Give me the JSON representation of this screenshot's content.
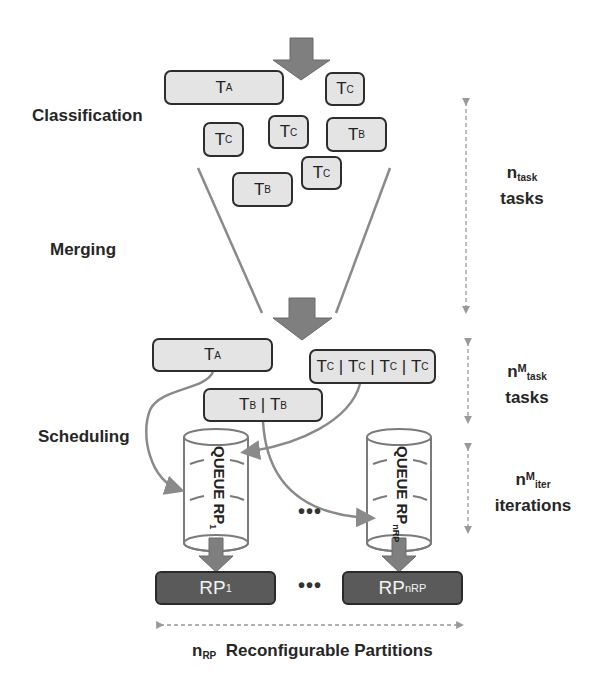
{
  "stages": {
    "classification": "Classification",
    "merging": "Merging",
    "scheduling": "Scheduling"
  },
  "classified_tasks": [
    {
      "base": "T",
      "sub": "A"
    },
    {
      "base": "T",
      "sub": "C"
    },
    {
      "base": "T",
      "sub": "C"
    },
    {
      "base": "T",
      "sub": "C"
    },
    {
      "base": "T",
      "sub": "B"
    },
    {
      "base": "T",
      "sub": "C"
    },
    {
      "base": "T",
      "sub": "B"
    }
  ],
  "merged_tasks": {
    "a": {
      "base": "T",
      "sub": "A"
    },
    "c_chain": [
      {
        "base": "T",
        "sub": "C"
      },
      {
        "base": "T",
        "sub": "C"
      },
      {
        "base": "T",
        "sub": "C"
      },
      {
        "base": "T",
        "sub": "C"
      }
    ],
    "b_chain": [
      {
        "base": "T",
        "sub": "B"
      },
      {
        "base": "T",
        "sub": "B"
      }
    ],
    "separator": " | "
  },
  "queues": [
    {
      "label": "QUEUE RP",
      "sub": "1"
    },
    {
      "label": "QUEUE RP",
      "sub": "nRP"
    }
  ],
  "partitions": [
    {
      "label": "RP",
      "sub": "1"
    },
    {
      "label": "RP",
      "sub": "nRP"
    }
  ],
  "ellipsis": "•••",
  "side_annotations": {
    "tasks": {
      "n": "n",
      "sub": "task",
      "word": "tasks"
    },
    "merged_tasks": {
      "n": "n",
      "sup": "M",
      "sub": "task",
      "word": "tasks"
    },
    "iterations": {
      "n": "n",
      "sup": "M",
      "sub": "iter",
      "word": "iterations"
    }
  },
  "bottom_annotation": {
    "n": "n",
    "sub": "RP",
    "text": "Reconfigurable Partitions"
  },
  "colors": {
    "task_fill": "#e4e4e4",
    "task_border": "#2d2d2d",
    "arrow_fill": "#7f7f7f",
    "partition_fill": "#5a5a5a",
    "connector": "#8a8a8a"
  }
}
